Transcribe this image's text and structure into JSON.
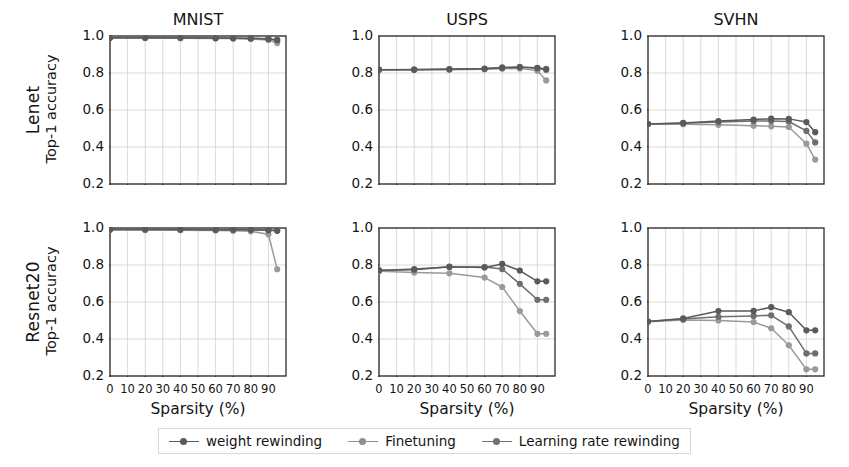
{
  "figure": {
    "row_labels": [
      "Lenet",
      "Resnet20"
    ],
    "column_titles": [
      "MNIST",
      "USPS",
      "SVHN"
    ],
    "ylabel": "Top-1 accuracy",
    "xlabel": "Sparsity (%)",
    "y_ticks": [
      "1.0",
      "0.8",
      "0.6",
      "0.4",
      "0.2"
    ],
    "x_ticks": [
      "0",
      "10",
      "20",
      "30",
      "40",
      "50",
      "60",
      "70",
      "80",
      "90"
    ]
  },
  "legend": {
    "items": [
      {
        "label": "weight rewinding",
        "color": "#5a5a5a"
      },
      {
        "label": "Finetuning",
        "color": "#8f8f8f"
      },
      {
        "label": "Learning rate rewinding",
        "color": "#707070"
      }
    ]
  },
  "colors": {
    "weight_rewinding": "#5a5a5a",
    "finetuning": "#9a9a9a",
    "learning_rate_rewinding": "#6e6e6e",
    "axis": "#2b2b2b",
    "grid": "#cfcfcf",
    "background": "#ffffff"
  },
  "chart_data": {
    "type": "line",
    "xlabel": "Sparsity (%)",
    "ylabel": "Top-1 accuracy",
    "xlim": [
      0,
      100
    ],
    "ylim": [
      0.2,
      1.0
    ],
    "y_ticks": [
      1.0,
      0.8,
      0.6,
      0.4,
      0.2
    ],
    "x_ticks": [
      0,
      10,
      20,
      30,
      40,
      50,
      60,
      70,
      80,
      90
    ],
    "grid": true,
    "legend_position": "bottom-center",
    "panels": [
      {
        "row": "Lenet",
        "column": "MNIST",
        "title": "MNIST",
        "x": [
          0,
          20,
          40,
          60,
          70,
          80,
          90,
          95
        ],
        "series": [
          {
            "name": "weight rewinding",
            "values": [
              0.991,
              0.99,
              0.99,
              0.989,
              0.988,
              0.987,
              0.984,
              0.977
            ]
          },
          {
            "name": "Finetuning",
            "values": [
              0.991,
              0.989,
              0.988,
              0.987,
              0.986,
              0.984,
              0.978,
              0.962
            ]
          },
          {
            "name": "Learning rate rewinding",
            "values": [
              0.991,
              0.99,
              0.99,
              0.989,
              0.989,
              0.988,
              0.985,
              0.98
            ]
          }
        ]
      },
      {
        "row": "Lenet",
        "column": "USPS",
        "title": "USPS",
        "x": [
          0,
          20,
          40,
          60,
          70,
          80,
          90,
          95
        ],
        "series": [
          {
            "name": "weight rewinding",
            "values": [
              0.818,
              0.818,
              0.82,
              0.823,
              0.828,
              0.831,
              0.826,
              0.818
            ]
          },
          {
            "name": "Finetuning",
            "values": [
              0.818,
              0.817,
              0.818,
              0.82,
              0.823,
              0.825,
              0.812,
              0.76
            ]
          },
          {
            "name": "Learning rate rewinding",
            "values": [
              0.818,
              0.819,
              0.821,
              0.824,
              0.83,
              0.833,
              0.828,
              0.822
            ]
          }
        ]
      },
      {
        "row": "Lenet",
        "column": "SVHN",
        "title": "SVHN",
        "x": [
          0,
          20,
          40,
          60,
          70,
          80,
          90,
          95
        ],
        "series": [
          {
            "name": "weight rewinding",
            "values": [
              0.524,
              0.53,
              0.54,
              0.548,
              0.553,
              0.552,
              0.535,
              0.48
            ]
          },
          {
            "name": "Finetuning",
            "values": [
              0.524,
              0.523,
              0.52,
              0.515,
              0.512,
              0.508,
              0.418,
              0.332
            ]
          },
          {
            "name": "Learning rate rewinding",
            "values": [
              0.524,
              0.528,
              0.535,
              0.54,
              0.54,
              0.538,
              0.487,
              0.425
            ]
          }
        ]
      },
      {
        "row": "Resnet20",
        "column": "MNIST",
        "title": "MNIST",
        "x": [
          0,
          20,
          40,
          60,
          70,
          80,
          90,
          95
        ],
        "series": [
          {
            "name": "weight rewinding",
            "values": [
              0.992,
              0.992,
              0.992,
              0.991,
              0.991,
              0.99,
              0.988,
              0.985
            ]
          },
          {
            "name": "Finetuning",
            "values": [
              0.99,
              0.989,
              0.988,
              0.987,
              0.985,
              0.982,
              0.966,
              0.777
            ]
          },
          {
            "name": "Learning rate rewinding",
            "values": [
              0.992,
              0.992,
              0.992,
              0.991,
              0.991,
              0.991,
              0.989,
              0.986
            ]
          }
        ]
      },
      {
        "row": "Resnet20",
        "column": "USPS",
        "title": "USPS",
        "x": [
          0,
          20,
          40,
          60,
          70,
          80,
          90,
          95
        ],
        "series": [
          {
            "name": "weight rewinding",
            "values": [
              0.772,
              0.775,
              0.791,
              0.787,
              0.806,
              0.77,
              0.712,
              0.712
            ]
          },
          {
            "name": "Finetuning",
            "values": [
              0.766,
              0.76,
              0.755,
              0.732,
              0.681,
              0.551,
              0.428,
              0.428
            ]
          },
          {
            "name": "Learning rate rewinding",
            "values": [
              0.77,
              0.778,
              0.789,
              0.789,
              0.778,
              0.698,
              0.612,
              0.612
            ]
          }
        ]
      },
      {
        "row": "Resnet20",
        "column": "SVHN",
        "title": "SVHN",
        "x": [
          0,
          20,
          40,
          60,
          70,
          80,
          90,
          95
        ],
        "series": [
          {
            "name": "weight rewinding",
            "values": [
              0.494,
              0.511,
              0.551,
              0.552,
              0.572,
              0.545,
              0.447,
              0.447
            ]
          },
          {
            "name": "Finetuning",
            "values": [
              0.493,
              0.503,
              0.5,
              0.492,
              0.458,
              0.366,
              0.236,
              0.236
            ]
          },
          {
            "name": "Learning rate rewinding",
            "values": [
              0.494,
              0.508,
              0.52,
              0.525,
              0.528,
              0.468,
              0.322,
              0.322
            ]
          }
        ]
      }
    ]
  }
}
